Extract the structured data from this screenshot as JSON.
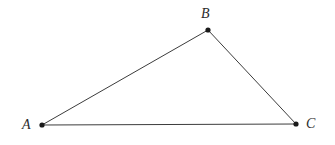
{
  "figure": {
    "background_color": "#ffffff",
    "stroke_color": "#3c3c3c",
    "vertex_color": "#1a1a1a",
    "label_color": "#2b2b2b",
    "stroke_width": 1,
    "vertex_radius": 2.6,
    "canvas": {
      "width": 335,
      "height": 145
    }
  },
  "vertices": [
    {
      "id": "A",
      "label": "A",
      "x": 42,
      "y": 125,
      "label_x": 22,
      "label_y": 118
    },
    {
      "id": "B",
      "label": "B",
      "x": 208,
      "y": 30,
      "label_x": 201,
      "label_y": 7
    },
    {
      "id": "C",
      "label": "C",
      "x": 296,
      "y": 124,
      "label_x": 306,
      "label_y": 117
    }
  ],
  "edges": [
    {
      "id": "AB",
      "from": "A",
      "to": "B",
      "x1": 42,
      "y1": 125,
      "x2": 208,
      "y2": 30
    },
    {
      "id": "BC",
      "from": "B",
      "to": "C",
      "x1": 208,
      "y1": 30,
      "x2": 296,
      "y2": 124
    },
    {
      "id": "CA",
      "from": "C",
      "to": "A",
      "x1": 296,
      "y1": 124,
      "x2": 42,
      "y2": 125
    }
  ]
}
